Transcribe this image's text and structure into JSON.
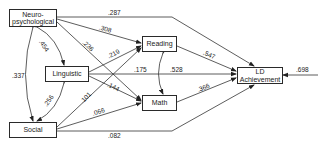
{
  "diagram": {
    "type": "path-diagram",
    "nodes": {
      "neuro": {
        "line1": "Neuro-",
        "line2": "psychological"
      },
      "linguistic": {
        "label": "Linguistic"
      },
      "social": {
        "label": "Social"
      },
      "reading": {
        "label": "Reading"
      },
      "math": {
        "label": "Math"
      },
      "ld": {
        "line1": "LD",
        "line2": "Achievement"
      }
    },
    "paths": [
      {
        "from": "Neuro-psychological",
        "to": "LD Achievement",
        "coef": ".287"
      },
      {
        "from": "Neuro-psychological",
        "to": "Reading",
        "coef": ".308"
      },
      {
        "from": "Neuro-psychological",
        "to": "Math",
        "coef": ".236"
      },
      {
        "from": "Linguistic",
        "to": "Reading",
        "coef": ".219"
      },
      {
        "from": "Linguistic",
        "to": "LD Achievement",
        "coef": ".175"
      },
      {
        "from": "Linguistic",
        "to": "Math",
        "coef": ".144"
      },
      {
        "from": "Social",
        "to": "Reading",
        "coef": ".101"
      },
      {
        "from": "Social",
        "to": "Math",
        "coef": ".066"
      },
      {
        "from": "Social",
        "to": "LD Achievement",
        "coef": ".082"
      },
      {
        "from": "Reading",
        "to": "LD Achievement",
        "coef": ".547"
      },
      {
        "from": "Math",
        "to": "LD Achievement",
        "coef": ".366"
      },
      {
        "from": "Residual",
        "to": "LD Achievement",
        "coef": ".698"
      }
    ],
    "correlations": [
      {
        "a": "Neuro-psychological",
        "b": "Linguistic",
        "coef": ".454"
      },
      {
        "a": "Neuro-psychological",
        "b": "Social",
        "coef": ".337"
      },
      {
        "a": "Linguistic",
        "b": "Social",
        "coef": ".256"
      },
      {
        "a": "Reading",
        "b": "Math",
        "coef": ".528"
      }
    ],
    "labels": {
      "p287": ".287",
      "p308": ".308",
      "p236": ".236",
      "p219": ".219",
      "p175": ".175",
      "p144": ".144",
      "p101": ".101",
      "p066": ".066",
      "p082": ".082",
      "p547": ".547",
      "p366": ".366",
      "p698": ".698",
      "c454": ".454",
      "c337": ".337",
      "c256": ".256",
      "c528": ".528"
    }
  }
}
